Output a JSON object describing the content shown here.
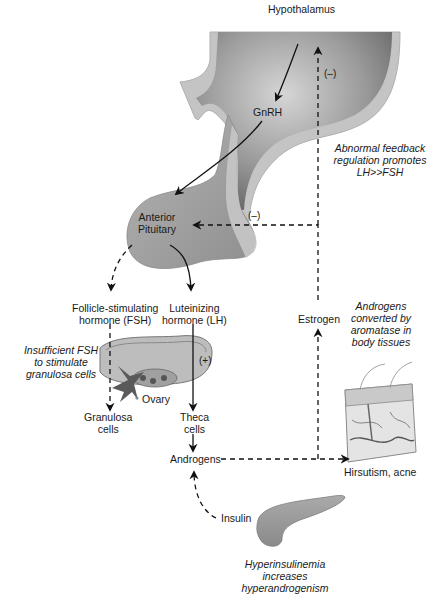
{
  "diagram": {
    "title_implied": "Pathophysiology of polycystic ovary syndrome",
    "nodes": {
      "hypothalamus": "Hypothalamus",
      "gnrh": "GnRH",
      "anterior_pituitary_line1": "Anterior",
      "anterior_pituitary_line2": "Pituitary",
      "fsh_line1": "Follicle-stimulating",
      "fsh_line2": "hormone (FSH)",
      "lh_line1": "Luteinizing",
      "lh_line2": "hormone (LH)",
      "ovary": "Ovary",
      "granulosa_line1": "Granulosa",
      "granulosa_line2": "cells",
      "theca_line1": "Theca",
      "theca_line2": "cells",
      "androgens": "Androgens",
      "estrogen": "Estrogen",
      "insulin": "Insulin",
      "hirsutism": "Hirsutism, acne"
    },
    "annotations": {
      "feedback": [
        "Abnormal feedback",
        "regulation promotes",
        "LH>>FSH"
      ],
      "fsh_insufficient": [
        "Insufficient FSH",
        "to stimulate",
        "granulosa cells"
      ],
      "aromatase": [
        "Androgens",
        "converted by",
        "aromatase in",
        "body tissues"
      ],
      "hyperinsulinemia": [
        "Hyperinsulinemia",
        "increases",
        "hyperandrogenism"
      ]
    },
    "signs": {
      "neg_hypothalamus": "(–)",
      "neg_pituitary": "(–)",
      "pos_lh": "(+)"
    },
    "edges": [
      {
        "from": "Hypothalamus",
        "to": "GnRH",
        "style": "solid"
      },
      {
        "from": "GnRH",
        "to": "Anterior Pituitary",
        "style": "solid"
      },
      {
        "from": "Anterior Pituitary",
        "to": "FSH",
        "style": "dashed"
      },
      {
        "from": "Anterior Pituitary",
        "to": "LH",
        "style": "solid"
      },
      {
        "from": "FSH",
        "to": "Granulosa cells",
        "style": "dashed"
      },
      {
        "from": "LH",
        "to": "Theca cells",
        "style": "solid",
        "sign": "(+)"
      },
      {
        "from": "Theca cells",
        "to": "Androgens",
        "style": "solid"
      },
      {
        "from": "Androgens",
        "to": "Hirsutism, acne",
        "style": "dashed"
      },
      {
        "from": "Androgens",
        "to": "Estrogen",
        "style": "dashed"
      },
      {
        "from": "Estrogen",
        "to": "Hypothalamus",
        "style": "dashed",
        "sign": "(–)"
      },
      {
        "from": "Estrogen",
        "to": "Anterior Pituitary",
        "style": "dashed",
        "sign": "(–)"
      },
      {
        "from": "Insulin",
        "to": "Androgens",
        "style": "dashed"
      }
    ],
    "colors": {
      "brain_dark": "#6e6e6e",
      "brain_light": "#c8c8c8",
      "brain_rim": "#bdbdbd",
      "pituitary": "#a9a9a9",
      "line": "#111111"
    }
  }
}
